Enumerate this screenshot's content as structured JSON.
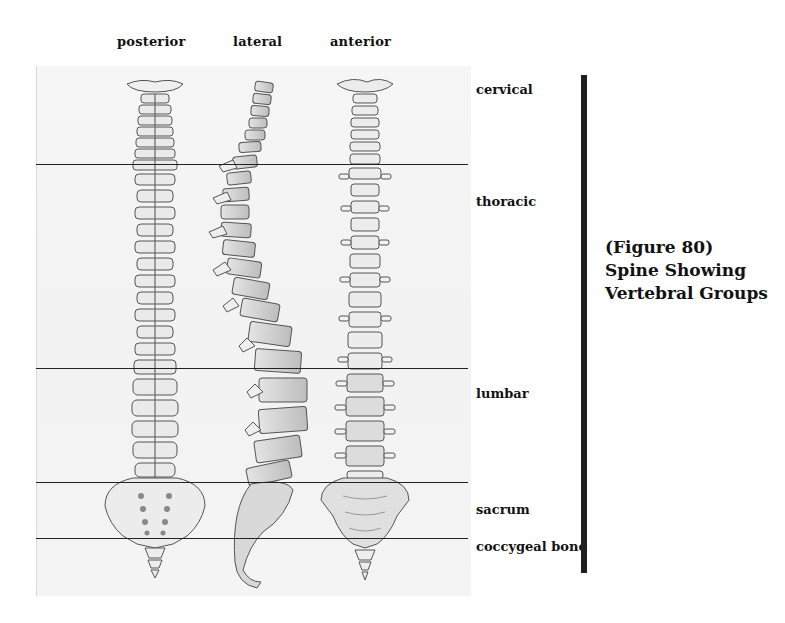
{
  "views": [
    {
      "label": "posterior"
    },
    {
      "label": "lateral"
    },
    {
      "label": "anterior"
    }
  ],
  "regions": [
    {
      "label": "cervical"
    },
    {
      "label": "thoracic"
    },
    {
      "label": "lumbar"
    },
    {
      "label": "sacrum"
    },
    {
      "label": "coccygeal bone"
    }
  ],
  "caption": {
    "line1": "(Figure 80)",
    "line2": "Spine Showing",
    "line3": "Vertebral Groups"
  },
  "colors": {
    "ink": "#111111",
    "bar": "#1f1f1f",
    "paper": "#f4f4f4",
    "pencil": "#555555"
  }
}
